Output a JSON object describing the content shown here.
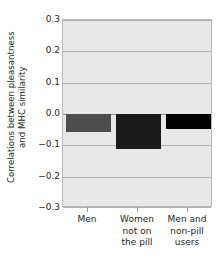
{
  "chart_data": {
    "type": "bar",
    "title": "",
    "xlabel": "",
    "ylabel_lines": [
      "Correlations between pleasantness",
      "and MHC similarity"
    ],
    "ylabel": "Correlations between pleasantness and MHC similarity",
    "categories": [
      "Men",
      "Women not on the pill",
      "Men and non-pill users"
    ],
    "category_label_lines": [
      [
        "Men"
      ],
      [
        "Women",
        "not on",
        "the pill"
      ],
      [
        "Men and",
        "non-pill",
        "users"
      ]
    ],
    "values": [
      -0.057,
      -0.112,
      -0.048
    ],
    "bar_colors": [
      "#4d4d4d",
      "#1a1a1a",
      "#000000"
    ],
    "ylim": [
      -0.3,
      0.3
    ],
    "yticks": [
      0.3,
      0.2,
      0.1,
      0.0,
      -0.1,
      -0.2,
      -0.3
    ],
    "ytick_labels": [
      "0.3",
      "0.2",
      "0.1",
      "0.0",
      "−0.1",
      "−0.2",
      "−0.3"
    ],
    "grid": true,
    "legend": false,
    "plot_background": "#e8e8e8",
    "gridline_color": "#b0b0b0"
  }
}
